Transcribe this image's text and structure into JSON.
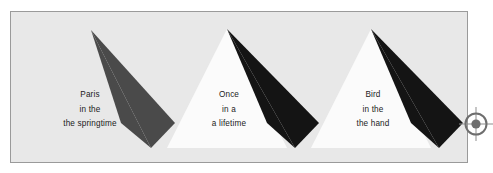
{
  "figure": {
    "background_color": "#ffffff",
    "panel": {
      "fill_color": "#e8e8e8",
      "border_color": "#9a9a9a"
    }
  },
  "groups": [
    {
      "id": "group-1",
      "caption_lines": [
        "Paris",
        "in the",
        "the springtime"
      ],
      "has_light_triangle": false,
      "dark_triangle_color": "#4a4a4a",
      "light_triangle_color": "#fbfbfb"
    },
    {
      "id": "group-2",
      "caption_lines": [
        "Once",
        "in a",
        "a lifetime"
      ],
      "has_light_triangle": true,
      "dark_triangle_color": "#141414",
      "light_triangle_color": "#fbfbfb"
    },
    {
      "id": "group-3",
      "caption_lines": [
        "Bird",
        "in the",
        "the hand"
      ],
      "has_light_triangle": true,
      "dark_triangle_color": "#141414",
      "light_triangle_color": "#fbfbfb"
    }
  ],
  "registration_mark": {
    "label": "registration-target",
    "ring_color": "#6e6e6e",
    "dot_color": "#6e6e6e"
  }
}
